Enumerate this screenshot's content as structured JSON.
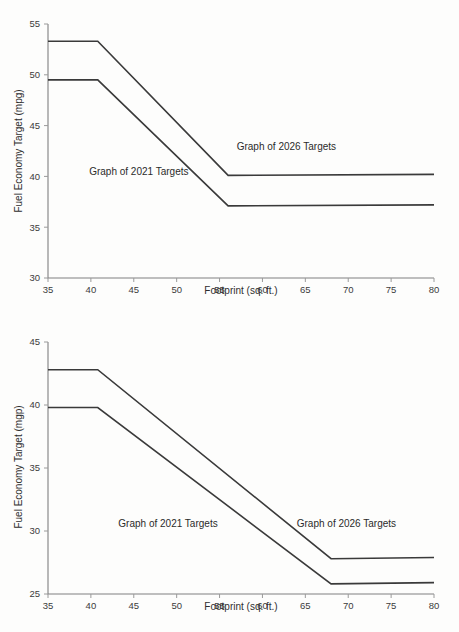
{
  "document": {
    "title": "Fuel Economy Target vs Footprint",
    "background_color": "#fdfdfc",
    "line_color": "#3a3a3a",
    "axis_color": "#808080",
    "text_color": "#2b2b2b"
  },
  "chart_data": [
    {
      "id": "top-chart",
      "type": "line",
      "title": "",
      "xlabel": "Footprint (sq. ft.)",
      "ylabel": "Fuel Economy Target (mpg)",
      "xlim": [
        35,
        80
      ],
      "ylim": [
        30,
        55
      ],
      "xticks": [
        35,
        40,
        45,
        50,
        55,
        60,
        65,
        70,
        75,
        80
      ],
      "yticks": [
        30,
        35,
        40,
        45,
        50,
        55
      ],
      "xtick_labels": [
        "35",
        "40",
        "45",
        "50",
        "55",
        "60",
        "65",
        "70",
        "75",
        "80"
      ],
      "ytick_labels": [
        "30",
        "35",
        "40",
        "45",
        "50",
        "55"
      ],
      "grid": false,
      "legend": "none",
      "series": [
        {
          "name": "Graph of 2026 Targets",
          "x": [
            35,
            40.8,
            56.0,
            80
          ],
          "values": [
            53.3,
            53.3,
            40.1,
            40.2
          ]
        },
        {
          "name": "Graph of 2021 Targets",
          "x": [
            35,
            40.8,
            56.0,
            80
          ],
          "values": [
            49.5,
            49.5,
            37.1,
            37.2
          ]
        }
      ],
      "annotations": [
        {
          "text": "Graph of 2026 Targets",
          "x": 57.0,
          "y": 42.6
        },
        {
          "text": "Graph of 2021 Targets",
          "x": 39.8,
          "y": 40.1
        }
      ]
    },
    {
      "id": "bottom-chart",
      "type": "line",
      "title": "",
      "xlabel": "Footprint (sq. ft.)",
      "ylabel": "Fuel Economy Target (mgp)",
      "xlim": [
        35,
        80
      ],
      "ylim": [
        25,
        45
      ],
      "xticks": [
        35,
        40,
        45,
        50,
        55,
        60,
        65,
        70,
        75,
        80
      ],
      "yticks": [
        25,
        30,
        35,
        40,
        45
      ],
      "xtick_labels": [
        "35",
        "40",
        "45",
        "50",
        "55",
        "60",
        "65",
        "70",
        "75",
        "80"
      ],
      "ytick_labels": [
        "25",
        "30",
        "35",
        "40",
        "45"
      ],
      "grid": false,
      "legend": "none",
      "series": [
        {
          "name": "Graph of 2026 Targets",
          "x": [
            35,
            40.8,
            68.0,
            80
          ],
          "values": [
            42.8,
            42.8,
            27.8,
            27.9
          ]
        },
        {
          "name": "Graph of 2021 Targets",
          "x": [
            35,
            40.8,
            68.0,
            80
          ],
          "values": [
            39.8,
            39.8,
            25.8,
            25.9
          ]
        }
      ],
      "annotations": [
        {
          "text": "Graph of 2021 Targets",
          "x": 43.2,
          "y": 30.3
        },
        {
          "text": "Graph of 2026 Targets",
          "x": 64.0,
          "y": 30.3
        }
      ]
    }
  ]
}
